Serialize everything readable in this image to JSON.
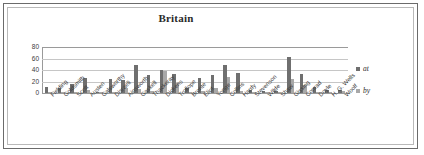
{
  "chart_data": {
    "type": "bar",
    "title": "Britain",
    "xlabel": "",
    "ylabel": "",
    "ylim": [
      0,
      80
    ],
    "yticks": [
      80,
      60,
      40,
      20,
      0
    ],
    "grid": true,
    "legend_position": "right",
    "categories": [
      "Fielding",
      "Goldsmith",
      "Scott",
      "Austen",
      "Galsworthy",
      "Disraeli",
      "Ainsworth",
      "Gaskell",
      "Thackeray",
      "Dickens",
      "Trollope",
      "Bronte",
      "Eliot",
      "Yonge",
      "Collins",
      "Hardy",
      "Stevenson",
      "Wilde",
      "Shaw",
      "Gissing",
      "Conrad",
      "Doyle",
      "H. G. Wells",
      "Woolf"
    ],
    "series": [
      {
        "name": "at",
        "color": "#6f6f6f",
        "values": [
          11,
          8,
          16,
          26,
          2,
          25,
          22,
          48,
          32,
          40,
          33,
          8,
          26,
          32,
          48,
          35,
          6,
          3,
          4,
          62,
          33,
          10,
          6,
          5
        ]
      },
      {
        "name": "by",
        "color": "#a8a8a8",
        "values": [
          1,
          1,
          1,
          6,
          1,
          2,
          9,
          7,
          3,
          38,
          17,
          1,
          3,
          9,
          28,
          4,
          2,
          1,
          1,
          25,
          14,
          2,
          1,
          3
        ]
      }
    ]
  },
  "legend": {
    "items": [
      {
        "label": "at"
      },
      {
        "label": "by"
      }
    ]
  }
}
